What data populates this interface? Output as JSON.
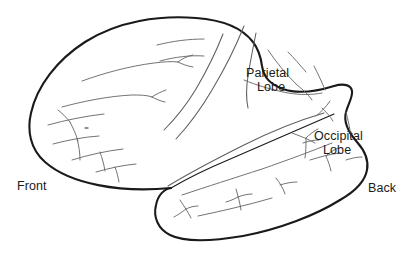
{
  "figure": {
    "background_color": "#ffffff",
    "outline_color": "#1a1a1a",
    "sulci_color": "#6b6b6b",
    "text_color": "#1a1a1a"
  },
  "labels": {
    "front": "Front",
    "back": "Back",
    "parietal": {
      "line1": "Parietal",
      "line2": "Lobe"
    },
    "occipital": {
      "line1": "Occipital",
      "line2": "Lobe"
    }
  },
  "annotations": [
    {
      "name": "front-label",
      "text": "Front",
      "x": 17,
      "y": 179
    },
    {
      "name": "back-label",
      "text": "Back",
      "x": 368,
      "y": 181
    },
    {
      "name": "parietal-lobe-label",
      "text": "Parietal Lobe",
      "x": 246,
      "y": 66
    },
    {
      "name": "occipital-lobe-label",
      "text": "Occipital Lobe",
      "x": 314,
      "y": 129
    }
  ]
}
